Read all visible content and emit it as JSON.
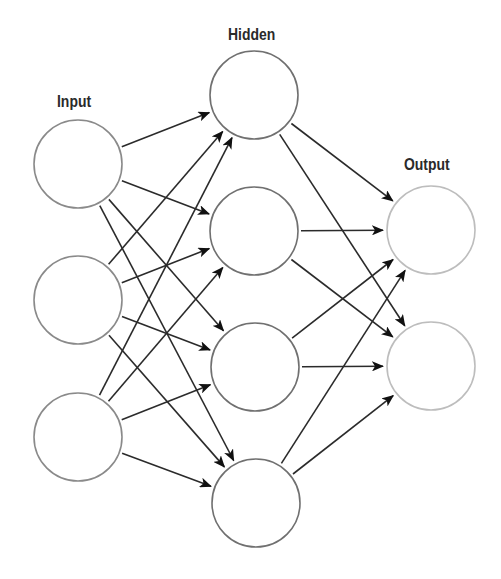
{
  "diagram": {
    "title": "",
    "type": "feedforward-neural-network",
    "layers": [
      {
        "label": "Input",
        "label_pos": {
          "x": 57,
          "y": 92
        },
        "stroke": "#8a8a8a",
        "nodes": [
          {
            "id": "i1",
            "cx": 78,
            "cy": 164
          },
          {
            "id": "i2",
            "cx": 78,
            "cy": 300
          },
          {
            "id": "i3",
            "cx": 78,
            "cy": 437
          }
        ]
      },
      {
        "label": "Hidden",
        "label_pos": {
          "x": 228,
          "y": 25
        },
        "stroke": "#707070",
        "nodes": [
          {
            "id": "h1",
            "cx": 254,
            "cy": 95
          },
          {
            "id": "h2",
            "cx": 254,
            "cy": 231
          },
          {
            "id": "h3",
            "cx": 255,
            "cy": 367
          },
          {
            "id": "h4",
            "cx": 256,
            "cy": 503
          }
        ]
      },
      {
        "label": "Output",
        "label_pos": {
          "x": 404,
          "y": 155
        },
        "stroke": "#bdbdbd",
        "nodes": [
          {
            "id": "o1",
            "cx": 431,
            "cy": 230
          },
          {
            "id": "o2",
            "cx": 431,
            "cy": 366
          }
        ]
      }
    ],
    "node_radius": 44,
    "edges": [
      [
        "i1",
        "h1"
      ],
      [
        "i1",
        "h2"
      ],
      [
        "i1",
        "h3"
      ],
      [
        "i1",
        "h4"
      ],
      [
        "i2",
        "h1"
      ],
      [
        "i2",
        "h2"
      ],
      [
        "i2",
        "h3"
      ],
      [
        "i2",
        "h4"
      ],
      [
        "i3",
        "h1"
      ],
      [
        "i3",
        "h2"
      ],
      [
        "i3",
        "h3"
      ],
      [
        "i3",
        "h4"
      ],
      [
        "h1",
        "o1"
      ],
      [
        "h1",
        "o2"
      ],
      [
        "h2",
        "o1"
      ],
      [
        "h2",
        "o2"
      ],
      [
        "h3",
        "o1"
      ],
      [
        "h3",
        "o2"
      ],
      [
        "h4",
        "o1"
      ],
      [
        "h4",
        "o2"
      ]
    ],
    "colors": {
      "background": "#ffffff",
      "edge": "#2b2b2b",
      "arrowhead": "#111111",
      "label": "#2a2a2a"
    }
  }
}
